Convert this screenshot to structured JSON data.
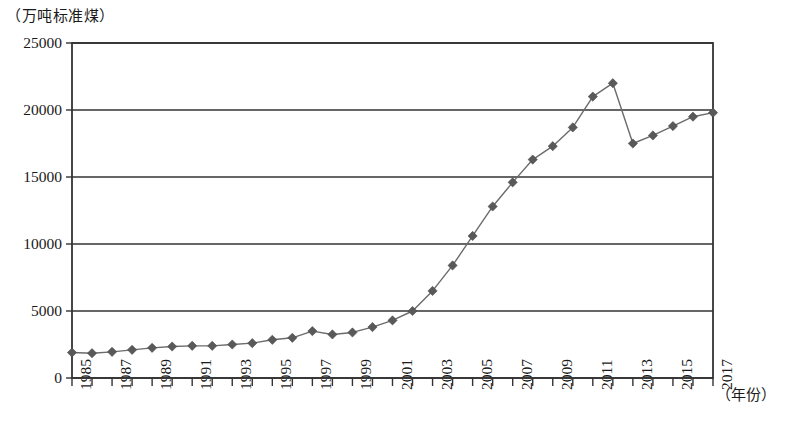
{
  "chart_data": {
    "type": "line",
    "title": "",
    "ylabel": "（万吨标准煤）",
    "xlabel": "（年份）",
    "ylim": [
      0,
      25000
    ],
    "y_ticks": [
      "0",
      "5000",
      "10000",
      "15000",
      "20000",
      "25000"
    ],
    "y_tick_values": [
      0,
      5000,
      10000,
      15000,
      20000,
      25000
    ],
    "grid": true,
    "legend": "none",
    "marker": "diamond",
    "marker_color": "#595959",
    "line_color": "#6b6b6b",
    "axis_color": "#333333",
    "x": [
      1985,
      1986,
      1987,
      1988,
      1989,
      1990,
      1991,
      1992,
      1993,
      1994,
      1995,
      1996,
      1997,
      1998,
      1999,
      2000,
      2001,
      2002,
      2003,
      2004,
      2005,
      2006,
      2007,
      2008,
      2009,
      2010,
      2011,
      2012,
      2013,
      2014,
      2015,
      2016,
      2017
    ],
    "x_tick_labels": [
      "1985",
      "1987",
      "1989",
      "1991",
      "1993",
      "1995",
      "1997",
      "1999",
      "2001",
      "2003",
      "2005",
      "2007",
      "2009",
      "2011",
      "2013",
      "2015",
      "2017"
    ],
    "x_tick_label_years": [
      1985,
      1987,
      1989,
      1991,
      1993,
      1995,
      1997,
      1999,
      2001,
      2003,
      2005,
      2007,
      2009,
      2011,
      2013,
      2015,
      2017
    ],
    "values": [
      1900,
      1850,
      1950,
      2100,
      2250,
      2350,
      2400,
      2400,
      2500,
      2600,
      2850,
      3000,
      3500,
      3250,
      3400,
      3800,
      4300,
      5000,
      6500,
      8400,
      10600,
      12800,
      14600,
      16300,
      17300,
      18700,
      21000,
      22000,
      17500,
      18100,
      18800,
      19500,
      19800
    ]
  }
}
